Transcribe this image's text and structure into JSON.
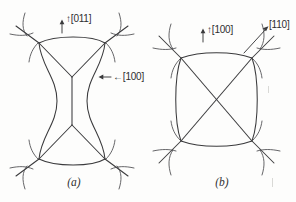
{
  "figure": {
    "background_color": "#fdfdfc",
    "ink_color": "#3a3a3c",
    "panels": [
      {
        "id": "a",
        "caption": "(a)",
        "shape": "hourglass-node-network",
        "labels": [
          {
            "name": "direction-label-011",
            "text": "↑[011]",
            "arrow": "up",
            "x": 59,
            "y": 19
          },
          {
            "name": "direction-label-100",
            "text": "←[100]",
            "arrow": "left",
            "x": 99,
            "y": 70
          }
        ]
      },
      {
        "id": "b",
        "caption": "(b)",
        "shape": "rounded-square-node-network",
        "labels": [
          {
            "name": "direction-label-100",
            "text": "↑[100]",
            "arrow": "up",
            "x": 52,
            "y": 28
          },
          {
            "name": "direction-label-110",
            "text": "[110]",
            "arrow": "diagonal",
            "x": 125,
            "y": 22
          }
        ]
      }
    ]
  }
}
